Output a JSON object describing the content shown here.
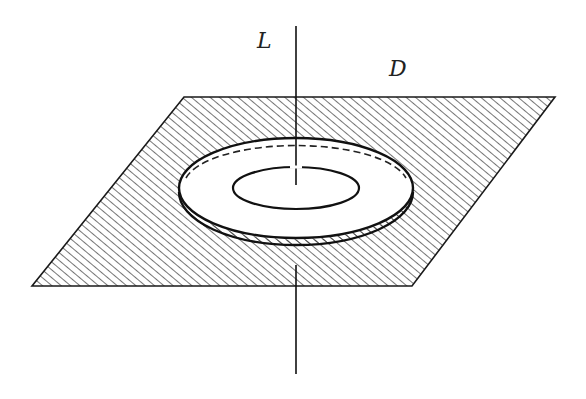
{
  "diagram": {
    "labels": {
      "line": "L",
      "surface": "D"
    },
    "colors": {
      "stroke": "#1a1a1a",
      "hatch": "#2a2a2a",
      "background": "#ffffff"
    }
  }
}
